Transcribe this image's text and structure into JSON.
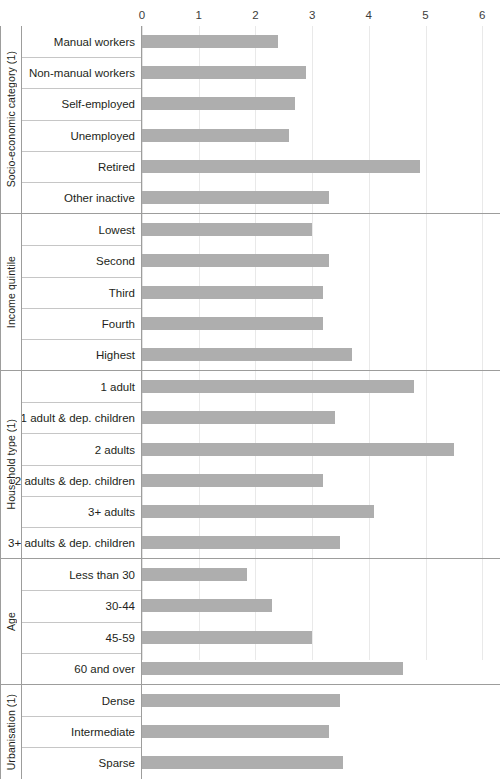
{
  "chart_data": {
    "type": "bar",
    "orientation": "horizontal",
    "title": "",
    "xlabel": "",
    "ylabel": "",
    "xlim": [
      0,
      6
    ],
    "xticks": [
      "0",
      "1",
      "2",
      "3",
      "4",
      "5",
      "6"
    ],
    "grid": true,
    "legend": false,
    "bar_color": "#aeaeae",
    "groups": [
      {
        "name": "Socio-economic category (1)",
        "categories": [
          "Manual workers",
          "Non-manual workers",
          "Self-employed",
          "Unemployed",
          "Retired",
          "Other inactive"
        ],
        "values": [
          2.4,
          2.9,
          2.7,
          2.6,
          4.9,
          3.3
        ]
      },
      {
        "name": "Income quintile",
        "categories": [
          "Lowest",
          "Second",
          "Third",
          "Fourth",
          "Highest"
        ],
        "values": [
          3.0,
          3.3,
          3.2,
          3.2,
          3.7
        ]
      },
      {
        "name": "Household type (1)",
        "categories": [
          "1 adult",
          "1 adult & dep. children",
          "2 adults",
          "2 adults & dep. children",
          "3+ adults",
          "3+ adults & dep. children"
        ],
        "values": [
          4.8,
          3.4,
          5.5,
          3.2,
          4.1,
          3.5
        ]
      },
      {
        "name": "Age",
        "categories": [
          "Less than 30",
          "30-44",
          "45-59",
          "60 and over"
        ],
        "values": [
          1.85,
          2.3,
          3.0,
          4.6
        ]
      },
      {
        "name": "Urbanisation (1)",
        "categories": [
          "Dense",
          "Intermediate",
          "Sparse"
        ],
        "values": [
          3.5,
          3.3,
          3.55
        ]
      }
    ]
  }
}
